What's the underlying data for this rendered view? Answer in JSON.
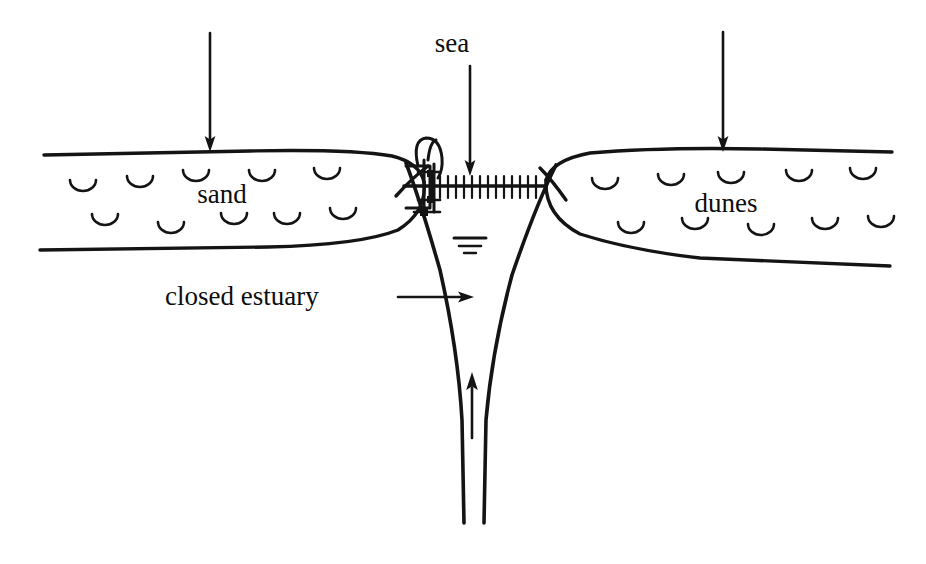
{
  "figure": {
    "type": "line-diagram",
    "width": 926,
    "height": 564,
    "ink_color": "#141414",
    "background_color": "#ffffff"
  },
  "labels": {
    "sea": "sea",
    "sand": "sand",
    "dunes": "dunes",
    "closed_estuary": "closed estuary"
  },
  "arrows": {
    "sea_arrow_name": "sea-arrow",
    "left_dune_arrow_name": "left-dune-arrow",
    "right_dune_arrow_name": "right-dune-arrow",
    "estuary_pointer_name": "closed-estuary-pointer-arrow",
    "channel_flow_arrow_name": "channel-flow-arrow"
  },
  "symbols": {
    "water_level": "water-level-symbol",
    "barrier": "hatched-barrier",
    "structure": "inlet-structure",
    "dune_mark": "dune-arc-mark"
  },
  "diagram_data": {
    "type": "annotated-sketch",
    "features": [
      {
        "name": "sand",
        "side": "left",
        "label": "sand",
        "hatch": "u-arcs"
      },
      {
        "name": "dunes",
        "side": "right",
        "label": "dunes",
        "hatch": "u-arcs"
      },
      {
        "name": "sea",
        "side": "top-center",
        "label": "sea"
      },
      {
        "name": "closed estuary",
        "side": "bottom-center",
        "label": "closed estuary"
      }
    ],
    "flow_directions": [
      {
        "name": "sea-arrow",
        "direction": "down",
        "from": "sea",
        "to": "inlet"
      },
      {
        "name": "left-dune-arrow",
        "direction": "down",
        "to": "sand"
      },
      {
        "name": "right-dune-arrow",
        "direction": "down",
        "to": "dunes"
      },
      {
        "name": "channel-flow-arrow",
        "direction": "up",
        "from": "estuary",
        "to": "inlet"
      },
      {
        "name": "closed-estuary-pointer-arrow",
        "direction": "right",
        "to": "estuary channel"
      }
    ]
  },
  "dune_marks": {
    "left": [
      [
        100,
        178
      ],
      [
        158,
        172
      ],
      [
        215,
        168
      ],
      [
        278,
        170
      ],
      [
        338,
        172
      ],
      [
        110,
        212
      ],
      [
        175,
        218
      ],
      [
        240,
        212
      ],
      [
        300,
        215
      ],
      [
        358,
        212
      ]
    ],
    "right": [
      [
        600,
        178
      ],
      [
        665,
        172
      ],
      [
        728,
        168
      ],
      [
        790,
        172
      ],
      [
        848,
        170
      ],
      [
        622,
        218
      ],
      [
        688,
        212
      ],
      [
        752,
        218
      ],
      [
        812,
        212
      ],
      [
        868,
        215
      ]
    ]
  }
}
